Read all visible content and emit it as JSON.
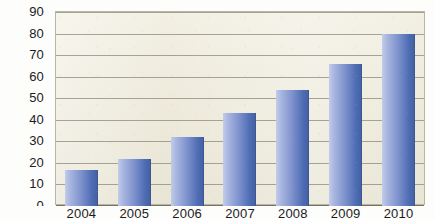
{
  "chart_data": {
    "type": "bar",
    "title": "",
    "subtitle": "",
    "xlabel": "",
    "ylabel": "",
    "categories": [
      "2004",
      "2005",
      "2006",
      "2007",
      "2008",
      "2009",
      "2010"
    ],
    "values": [
      16,
      21,
      31,
      42,
      53,
      65,
      79
    ],
    "series": [
      {
        "name": "",
        "values": [
          16,
          21,
          31,
          42,
          53,
          65,
          79
        ]
      }
    ],
    "ylim": [
      0,
      90
    ],
    "ytick_values": [
      0,
      10,
      20,
      30,
      40,
      50,
      60,
      70,
      80,
      90
    ],
    "ytick_labels": [
      "0",
      "10",
      "20",
      "30",
      "40",
      "50",
      "60",
      "70",
      "80",
      "90"
    ],
    "xtick_labels": [
      "2004",
      "2005",
      "2006",
      "2007",
      "2008",
      "2009",
      "2010"
    ],
    "grid": true,
    "grid_axis": "y",
    "legend": false,
    "legend_position": "none",
    "annotations": [],
    "colors": {
      "bar_light": "#c3cdea",
      "bar_mid": "#7f93cd",
      "bar_dark": "#43609f",
      "plot_background": "#e9e6d6",
      "grid_line": "#8d8878",
      "axis_line": "#6f6b5c",
      "plot_border": "#b9b5a3",
      "tick_label": "#1b1b1b",
      "page_background": "#fdfdfb"
    }
  }
}
